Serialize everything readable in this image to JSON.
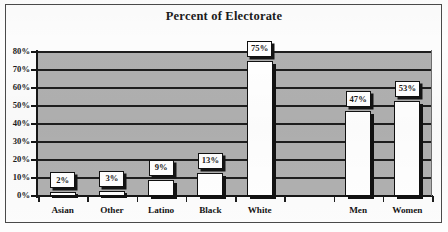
{
  "chart_data": {
    "type": "bar",
    "title": "Percent of Electorate",
    "xlabel": "",
    "ylabel": "",
    "ylim": [
      0,
      80
    ],
    "ytick_labels": [
      "0%",
      "10%",
      "20%",
      "30%",
      "40%",
      "50%",
      "60%",
      "70%",
      "80%"
    ],
    "ytick_values": [
      0,
      10,
      20,
      30,
      40,
      50,
      60,
      70,
      80
    ],
    "grid": true,
    "legend": "none",
    "plot_background": "#b0b0b0",
    "bar_fill": "#ffffff",
    "bar_outline": "#111111",
    "categories": [
      "Asian",
      "Other",
      "Latino",
      "Black",
      "White",
      "",
      "Men",
      "Women"
    ],
    "values": [
      2,
      3,
      9,
      13,
      75,
      null,
      47,
      53
    ],
    "data_labels": [
      "2%",
      "3%",
      "9%",
      "13%",
      "75%",
      "",
      "47%",
      "53%"
    ],
    "bars": [
      {
        "category": "Asian",
        "value": 2,
        "label": "2%"
      },
      {
        "category": "Other",
        "value": 3,
        "label": "3%"
      },
      {
        "category": "Latino",
        "value": 9,
        "label": "9%"
      },
      {
        "category": "Black",
        "value": 13,
        "label": "13%"
      },
      {
        "category": "White",
        "value": 75,
        "label": "75%"
      },
      {
        "category": "",
        "value": null,
        "label": ""
      },
      {
        "category": "Men",
        "value": 47,
        "label": "47%"
      },
      {
        "category": "Women",
        "value": 53,
        "label": "53%"
      }
    ]
  }
}
